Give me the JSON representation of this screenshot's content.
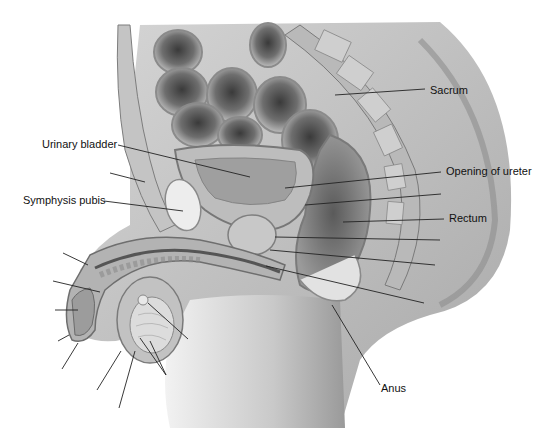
{
  "figure": {
    "labels": [
      {
        "id": "sacrum",
        "text": "Sacrum",
        "x": 430,
        "y": 84
      },
      {
        "id": "urinary-bladder",
        "text": "Urinary bladder",
        "x": 42,
        "y": 138
      },
      {
        "id": "opening-of-ureter",
        "text": "Opening of ureter",
        "x": 446,
        "y": 165
      },
      {
        "id": "symphysis-pubis",
        "text": "Symphysis pubis",
        "x": 23,
        "y": 194
      },
      {
        "id": "rectum",
        "text": "Rectum",
        "x": 449,
        "y": 212
      },
      {
        "id": "anus",
        "text": "Anus",
        "x": 381,
        "y": 382
      }
    ],
    "leader_lines": [
      {
        "for": "sacrum",
        "x1": 425,
        "y1": 89,
        "x2": 335,
        "y2": 95
      },
      {
        "for": "urinary-bladder",
        "x1": 118,
        "y1": 145,
        "x2": 250,
        "y2": 177
      },
      {
        "for": "opening-of-ureter",
        "x1": 441,
        "y1": 172,
        "x2": 285,
        "y2": 188
      },
      {
        "for": "symphysis-pubis",
        "x1": 104,
        "y1": 201,
        "x2": 183,
        "y2": 211
      },
      {
        "for": "rectum",
        "x1": 444,
        "y1": 219,
        "x2": 343,
        "y2": 222
      },
      {
        "for": "anus",
        "x1": 380,
        "y1": 385,
        "x2": 332,
        "y2": 305
      },
      {
        "for": "unlabeled",
        "x1": 441,
        "y1": 194,
        "x2": 305,
        "y2": 205
      },
      {
        "for": "unlabeled",
        "x1": 440,
        "y1": 240,
        "x2": 275,
        "y2": 237
      },
      {
        "for": "unlabeled",
        "x1": 435,
        "y1": 265,
        "x2": 270,
        "y2": 250
      },
      {
        "for": "unlabeled",
        "x1": 424,
        "y1": 303,
        "x2": 266,
        "y2": 266
      },
      {
        "for": "unlabeled",
        "x1": 110,
        "y1": 173,
        "x2": 145,
        "y2": 182
      },
      {
        "for": "unlabeled",
        "x1": 63,
        "y1": 253,
        "x2": 88,
        "y2": 265
      },
      {
        "for": "unlabeled",
        "x1": 53,
        "y1": 281,
        "x2": 100,
        "y2": 292
      },
      {
        "for": "unlabeled",
        "x1": 55,
        "y1": 310,
        "x2": 78,
        "y2": 310
      },
      {
        "for": "unlabeled",
        "x1": 58,
        "y1": 341,
        "x2": 69,
        "y2": 335
      },
      {
        "for": "unlabeled",
        "x1": 62,
        "y1": 369,
        "x2": 78,
        "y2": 343
      },
      {
        "for": "unlabeled",
        "x1": 97,
        "y1": 390,
        "x2": 121,
        "y2": 351
      },
      {
        "for": "unlabeled",
        "x1": 119,
        "y1": 408,
        "x2": 135,
        "y2": 351
      },
      {
        "for": "unlabeled",
        "x1": 188,
        "y1": 339,
        "x2": 148,
        "y2": 303
      },
      {
        "for": "unlabeled",
        "x1": 166,
        "y1": 375,
        "x2": 140,
        "y2": 338
      },
      {
        "for": "unlabeled",
        "x1": 166,
        "y1": 375,
        "x2": 150,
        "y2": 341
      }
    ]
  }
}
